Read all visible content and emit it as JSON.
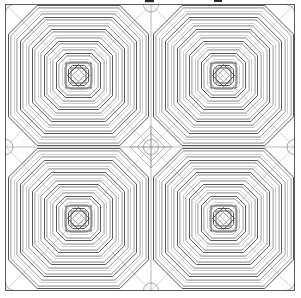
{
  "document": {
    "kind": "technical-line-drawing",
    "subject": "concentric octagonal tiling pattern",
    "background_color": "#ffffff",
    "width": 301,
    "height": 298
  },
  "colors": {
    "frame": "#4a4a4a",
    "ring_dark": "#3a3a3a",
    "ring_mid": "#6e6e6e",
    "ring_light": "#a8a8a8",
    "guide": "#9c9c9c",
    "guide_light": "#b8b8b8",
    "circle": "#8a8a8a",
    "tick": "#2b2b2b"
  },
  "frame": {
    "x": 5.5,
    "y": 4.5,
    "width": 289,
    "height": 286
  },
  "grid": {
    "center_x": 151,
    "center_y": 147,
    "columns": 2,
    "rows": 2,
    "cell_width": 144.5,
    "cell_height": 143,
    "show_centerlines": true,
    "show_diagonals": true
  },
  "blocks": [
    {
      "name": "block-top-left",
      "cx": 78.5,
      "cy": 75.5,
      "flip_x": false,
      "flip_y": false
    },
    {
      "name": "block-top-right",
      "cx": 223.5,
      "cy": 75.5,
      "flip_x": true,
      "flip_y": false
    },
    {
      "name": "block-bottom-left",
      "cx": 78.5,
      "cy": 218.5,
      "flip_x": false,
      "flip_y": true
    },
    {
      "name": "block-bottom-right",
      "cx": 223.5,
      "cy": 218.5,
      "flip_x": true,
      "flip_y": true
    }
  ],
  "block_geometry": {
    "shape": "octagon",
    "ring_count": 11,
    "ring_radii": [
      70,
      64,
      58,
      52,
      46,
      40,
      34,
      28,
      22,
      16,
      10
    ],
    "ring_band_offset": 2.4,
    "corner_cut_ratio": 0.41,
    "ring_weights": [
      "dark",
      "light",
      "dark",
      "light",
      "dark",
      "light",
      "dark",
      "light",
      "dark",
      "light",
      "dark"
    ]
  },
  "core": {
    "square_half": 12.5,
    "diamond_half": 11.0,
    "inner_square_half": 7.4,
    "inner_diamond_half": 6.2
  },
  "center_marker": {
    "circle_radius": 7.5,
    "diamond_half": 21,
    "inner_diamond_half": 14,
    "crosshair_length": 21
  },
  "corner_arcs": {
    "radius": 8.5,
    "positions": [
      "top-left",
      "top-right",
      "bottom-left",
      "bottom-right"
    ]
  },
  "edge_arcs": {
    "radius": 7.5,
    "positions": [
      "left-mid",
      "right-mid",
      "top-mid",
      "bottom-mid"
    ]
  },
  "tick_marks": [
    {
      "name": "tick-top-center",
      "x": 145,
      "y": 0,
      "width": 9,
      "height": 2.2
    },
    {
      "name": "tick-top-right",
      "x": 214,
      "y": 0,
      "width": 8,
      "height": 2.0
    }
  ]
}
